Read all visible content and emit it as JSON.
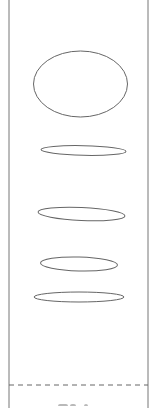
{
  "diagram": {
    "type": "shape-sketch",
    "colors": {
      "background": "#ffffff",
      "stroke": "#666666",
      "border": "#777777",
      "dashed_line": "#666666"
    },
    "frame": {
      "left_x": 9,
      "right_x": 148
    },
    "shapes": [
      {
        "kind": "ellipse",
        "cx": 80.5,
        "cy": 84,
        "rx": 47,
        "ry": 33,
        "rotate": 0
      },
      {
        "kind": "ellipse",
        "cx": 83.5,
        "cy": 150.5,
        "rx": 42.5,
        "ry": 4.8,
        "rotate": 1.2
      },
      {
        "kind": "ellipse",
        "cx": 81.5,
        "cy": 214,
        "rx": 43.5,
        "ry": 6.5,
        "rotate": 2.5
      },
      {
        "kind": "ellipse",
        "cx": 79,
        "cy": 264,
        "rx": 38.5,
        "ry": 7,
        "rotate": 1.5
      },
      {
        "kind": "ellipse",
        "cx": 79,
        "cy": 297,
        "rx": 45,
        "ry": 5,
        "rotate": 0
      }
    ],
    "separator": {
      "style": "dashed",
      "y": 385
    }
  }
}
